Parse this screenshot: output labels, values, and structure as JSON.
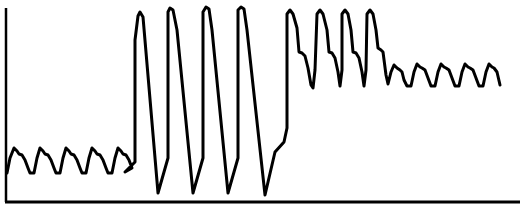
{
  "chart_data": {
    "type": "line",
    "title": "",
    "xlabel": "",
    "ylabel": "",
    "grid": false,
    "legend": null,
    "axes": {
      "y_axis": {
        "x": 6,
        "y_top": 8,
        "y_bottom": 202
      },
      "x_axis": {
        "y": 202,
        "x_left": 5,
        "x_right": 520
      }
    },
    "stroke_color": "#000000",
    "background_color": "#ffffff",
    "segments": [
      {
        "name": "low-amplitude baseline",
        "cycles": 5,
        "x_range": [
          7,
          135
        ],
        "y_min_px": 173,
        "y_peak_px": 148
      },
      {
        "name": "high-amplitude oscillation",
        "cycles": 4,
        "x_range": [
          135,
          285
        ],
        "y_min_px": 193,
        "y_peak_px": 12
      },
      {
        "name": "elevated with dicrotic notch",
        "cycles": 4,
        "x_range": [
          285,
          375
        ],
        "y_min_px": 88,
        "y_peak_px": 10
      },
      {
        "name": "elevated plateau small oscillation",
        "cycles": 5,
        "x_range": [
          375,
          500
        ],
        "y_min_px": 86,
        "y_peak_px": 61
      }
    ],
    "points": [
      [
        7,
        173
      ],
      [
        10,
        158
      ],
      [
        14,
        148
      ],
      [
        17,
        151
      ],
      [
        19,
        154
      ],
      [
        22,
        155
      ],
      [
        25,
        160
      ],
      [
        28,
        168
      ],
      [
        30,
        173
      ],
      [
        34,
        173
      ],
      [
        37,
        158
      ],
      [
        40,
        148
      ],
      [
        43,
        151
      ],
      [
        45,
        154
      ],
      [
        48,
        155
      ],
      [
        51,
        160
      ],
      [
        54,
        168
      ],
      [
        56,
        173
      ],
      [
        60,
        173
      ],
      [
        63,
        158
      ],
      [
        66,
        148
      ],
      [
        69,
        151
      ],
      [
        71,
        154
      ],
      [
        74,
        155
      ],
      [
        77,
        160
      ],
      [
        80,
        168
      ],
      [
        82,
        173
      ],
      [
        86,
        173
      ],
      [
        89,
        158
      ],
      [
        92,
        148
      ],
      [
        95,
        151
      ],
      [
        97,
        154
      ],
      [
        100,
        155
      ],
      [
        103,
        160
      ],
      [
        106,
        168
      ],
      [
        108,
        173
      ],
      [
        112,
        173
      ],
      [
        115,
        158
      ],
      [
        118,
        148
      ],
      [
        121,
        151
      ],
      [
        123,
        154
      ],
      [
        126,
        155
      ],
      [
        129,
        160
      ],
      [
        132,
        168
      ],
      [
        125,
        172
      ],
      [
        125,
        172
      ],
      [
        135,
        162
      ],
      [
        135,
        40
      ],
      [
        138,
        16
      ],
      [
        140,
        12
      ],
      [
        143,
        17
      ],
      [
        158,
        193
      ],
      [
        168,
        158
      ],
      [
        168,
        12
      ],
      [
        170,
        8
      ],
      [
        173,
        10
      ],
      [
        177,
        30
      ],
      [
        193,
        193
      ],
      [
        203,
        158
      ],
      [
        203,
        12
      ],
      [
        206,
        7
      ],
      [
        209,
        9
      ],
      [
        212,
        30
      ],
      [
        228,
        193
      ],
      [
        238,
        158
      ],
      [
        238,
        10
      ],
      [
        241,
        7
      ],
      [
        244,
        9
      ],
      [
        247,
        30
      ],
      [
        265,
        195
      ],
      [
        275,
        152
      ],
      [
        284,
        142
      ],
      [
        287,
        128
      ],
      [
        287,
        14
      ],
      [
        290,
        10
      ],
      [
        293,
        14
      ],
      [
        297,
        28
      ],
      [
        299,
        52
      ],
      [
        302,
        53
      ],
      [
        305,
        56
      ],
      [
        308,
        68
      ],
      [
        311,
        85
      ],
      [
        313,
        88
      ],
      [
        315,
        70
      ],
      [
        317,
        14
      ],
      [
        320,
        10
      ],
      [
        323,
        14
      ],
      [
        327,
        30
      ],
      [
        329,
        52
      ],
      [
        332,
        53
      ],
      [
        335,
        58
      ],
      [
        338,
        72
      ],
      [
        340,
        86
      ],
      [
        342,
        70
      ],
      [
        342,
        14
      ],
      [
        345,
        10
      ],
      [
        348,
        14
      ],
      [
        351,
        30
      ],
      [
        353,
        52
      ],
      [
        356,
        53
      ],
      [
        359,
        58
      ],
      [
        362,
        72
      ],
      [
        364,
        86
      ],
      [
        366,
        70
      ],
      [
        367,
        14
      ],
      [
        370,
        10
      ],
      [
        373,
        14
      ],
      [
        376,
        30
      ],
      [
        378,
        48
      ],
      [
        381,
        50
      ],
      [
        383,
        52
      ],
      [
        386,
        75
      ],
      [
        388,
        84
      ],
      [
        391,
        72
      ],
      [
        394,
        65
      ],
      [
        397,
        68
      ],
      [
        400,
        70
      ],
      [
        402,
        72
      ],
      [
        404,
        80
      ],
      [
        407,
        86
      ],
      [
        411,
        86
      ],
      [
        414,
        72
      ],
      [
        417,
        64
      ],
      [
        420,
        67
      ],
      [
        422,
        68
      ],
      [
        425,
        70
      ],
      [
        428,
        78
      ],
      [
        431,
        86
      ],
      [
        435,
        86
      ],
      [
        438,
        72
      ],
      [
        441,
        64
      ],
      [
        444,
        67
      ],
      [
        446,
        68
      ],
      [
        449,
        70
      ],
      [
        452,
        78
      ],
      [
        455,
        86
      ],
      [
        459,
        86
      ],
      [
        462,
        72
      ],
      [
        465,
        64
      ],
      [
        468,
        67
      ],
      [
        470,
        68
      ],
      [
        473,
        70
      ],
      [
        476,
        78
      ],
      [
        479,
        86
      ],
      [
        483,
        86
      ],
      [
        486,
        72
      ],
      [
        489,
        64
      ],
      [
        492,
        67
      ],
      [
        494,
        68
      ],
      [
        497,
        72
      ],
      [
        500,
        85
      ]
    ]
  }
}
